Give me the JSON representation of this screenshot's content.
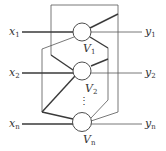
{
  "diagram": {
    "inputs": [
      {
        "name": "x",
        "sub": "1"
      },
      {
        "name": "x",
        "sub": "2"
      },
      {
        "name": "x",
        "sub": "n"
      }
    ],
    "outputs": [
      {
        "name": "y",
        "sub": "1"
      },
      {
        "name": "y",
        "sub": "2"
      },
      {
        "name": "y",
        "sub": "n"
      }
    ],
    "nodes": [
      {
        "name": "V",
        "sub": "1"
      },
      {
        "name": "V",
        "sub": "2"
      },
      {
        "name": "V",
        "sub": "n"
      }
    ],
    "ellipsis": "⋮",
    "colors": {
      "line": "#3a3a3a",
      "background": "#ffffff"
    }
  }
}
